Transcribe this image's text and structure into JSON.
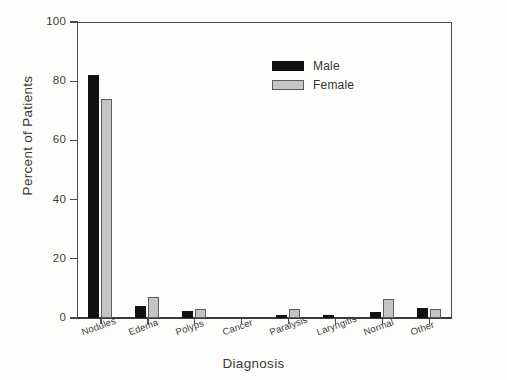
{
  "chart_data": {
    "type": "bar",
    "title": "",
    "xlabel": "Diagnosis",
    "ylabel": "Percent of Patients",
    "categories": [
      "Nodules",
      "Edema",
      "Polyps",
      "Cancer",
      "Paralysis",
      "Laryngitis",
      "Normal",
      "Other"
    ],
    "series": [
      {
        "name": "Male",
        "color": "#111111",
        "values": [
          82,
          4,
          2.5,
          0,
          1,
          1,
          2,
          3.5
        ]
      },
      {
        "name": "Female",
        "color": "#c4c4c4",
        "values": [
          74,
          7,
          3,
          0,
          3,
          0,
          6.5,
          3
        ]
      }
    ],
    "ylim": [
      0,
      100
    ],
    "yticks": [
      0,
      20,
      40,
      60,
      80,
      100
    ],
    "ytick_labels": [
      "0",
      "20",
      "40",
      "60",
      "80",
      "100"
    ],
    "grid": false,
    "legend_position": "upper-center-right",
    "legend_entries": [
      "Male",
      "Female"
    ]
  }
}
